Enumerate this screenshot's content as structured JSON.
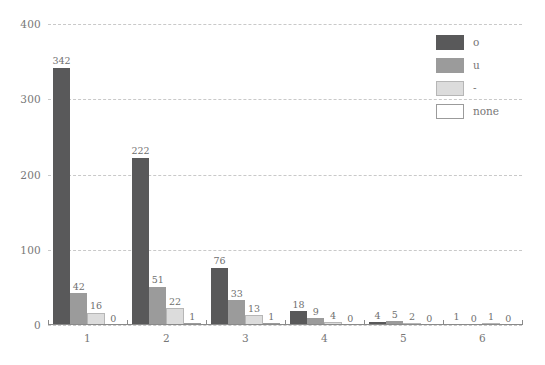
{
  "chart_data": {
    "type": "bar",
    "title": "",
    "xlabel": "",
    "ylabel": "",
    "categories": [
      "1",
      "2",
      "3",
      "4",
      "5",
      "6"
    ],
    "series": [
      {
        "name": "o",
        "color": "#59595a",
        "values": [
          342,
          222,
          76,
          18,
          4,
          1
        ]
      },
      {
        "name": "u",
        "color": "#9b9b9b",
        "values": [
          42,
          51,
          33,
          9,
          5,
          0
        ]
      },
      {
        "name": "-",
        "color": "#dcdcdc",
        "values": [
          16,
          22,
          13,
          4,
          2,
          1
        ]
      },
      {
        "name": "none",
        "color": "#ffffff",
        "values": [
          0,
          1,
          1,
          0,
          0,
          0
        ]
      }
    ],
    "ylim": [
      0,
      400
    ],
    "yticks": [
      0,
      100,
      200,
      300,
      400
    ],
    "ytick_labels": [
      "0",
      "100",
      "200",
      "300",
      "400"
    ],
    "grid": true,
    "grid_style": "dashed",
    "grid_color": "#c9c9c9",
    "legend_position": "top-right",
    "show_value_labels": true,
    "background": "#ffffff",
    "axis_color": "#8a8a8a",
    "text_color": "#777777"
  }
}
